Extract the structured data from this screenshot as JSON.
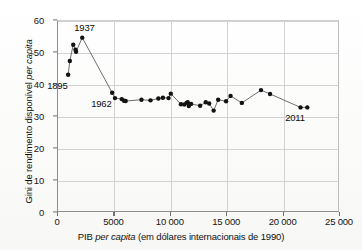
{
  "chart_data": {
    "type": "scatter",
    "title": "",
    "subtitle": "",
    "xlabel": "PIB per capita (em dólares internacionais de 1990)",
    "xlabel_parts": {
      "pre": "PIB ",
      "italic": "per capita",
      "post": " (em dólares internacionais de 1990)"
    },
    "ylabel": "Gini de rendimento disponível per capita",
    "ylabel_parts": {
      "pre": "Gini de rendimento disponível ",
      "italic": "per capita",
      "post": ""
    },
    "xlim": [
      0,
      25000
    ],
    "ylim": [
      0,
      60
    ],
    "xticks": [
      0,
      5000,
      10000,
      15000,
      20000,
      25000
    ],
    "xtick_labels": [
      "0",
      "5000",
      "10 000",
      "15 000",
      "20 000",
      "25 000"
    ],
    "yticks": [
      0,
      10,
      20,
      30,
      40,
      50,
      60
    ],
    "ytick_labels": [
      "0",
      "10",
      "20",
      "30",
      "40",
      "50",
      "60"
    ],
    "grid": true,
    "legend": "none",
    "connected": true,
    "marker_color": "#121212",
    "line_color": "#4a4a4a",
    "annotations": [
      {
        "label": "1895",
        "x": 900,
        "y": 43.2,
        "pos": "below-left"
      },
      {
        "label": "1937",
        "x": 2150,
        "y": 54.8,
        "pos": "above"
      },
      {
        "label": "1962",
        "x": 4800,
        "y": 37.6,
        "pos": "below-left"
      },
      {
        "label": "2011",
        "x": 22000,
        "y": 33.0,
        "pos": "below-left"
      }
    ],
    "points": [
      {
        "x": 900,
        "y": 43.2
      },
      {
        "x": 1050,
        "y": 47.5
      },
      {
        "x": 1350,
        "y": 52.6
      },
      {
        "x": 1550,
        "y": 51.0
      },
      {
        "x": 1600,
        "y": 50.4
      },
      {
        "x": 2150,
        "y": 54.8
      },
      {
        "x": 4800,
        "y": 37.6
      },
      {
        "x": 5050,
        "y": 35.9
      },
      {
        "x": 5650,
        "y": 35.6
      },
      {
        "x": 5850,
        "y": 35.1
      },
      {
        "x": 6000,
        "y": 35.0
      },
      {
        "x": 7400,
        "y": 35.4
      },
      {
        "x": 8200,
        "y": 35.2
      },
      {
        "x": 8900,
        "y": 35.8
      },
      {
        "x": 9300,
        "y": 36.0
      },
      {
        "x": 9800,
        "y": 35.9
      },
      {
        "x": 10000,
        "y": 37.3
      },
      {
        "x": 10900,
        "y": 34.0
      },
      {
        "x": 11200,
        "y": 33.9
      },
      {
        "x": 11400,
        "y": 34.4
      },
      {
        "x": 11500,
        "y": 34.6
      },
      {
        "x": 11600,
        "y": 33.4
      },
      {
        "x": 11800,
        "y": 34.1
      },
      {
        "x": 12600,
        "y": 33.5
      },
      {
        "x": 13100,
        "y": 34.6
      },
      {
        "x": 13400,
        "y": 34.2
      },
      {
        "x": 13800,
        "y": 32.0
      },
      {
        "x": 14200,
        "y": 35.4
      },
      {
        "x": 14900,
        "y": 34.9
      },
      {
        "x": 15300,
        "y": 36.6
      },
      {
        "x": 16300,
        "y": 34.4
      },
      {
        "x": 18000,
        "y": 38.4
      },
      {
        "x": 18800,
        "y": 37.2
      },
      {
        "x": 21500,
        "y": 33.0
      },
      {
        "x": 22100,
        "y": 33.0
      }
    ]
  }
}
